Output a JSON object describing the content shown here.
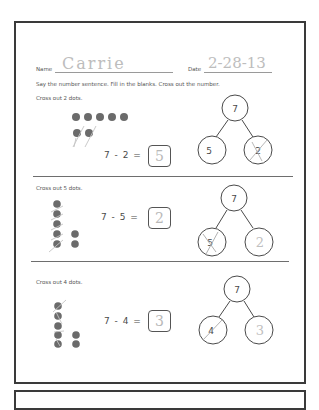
{
  "header": {
    "name_label": "Name",
    "name_value": "Carrie",
    "date_label": "Date",
    "date_value": "2-28-13",
    "instructions": "Say the number sentence. Fill in the blanks.  Cross out the number."
  },
  "problems": [
    {
      "prompt": "Cross out 2 dots.",
      "equation": "7 - 2 =",
      "answer": "5",
      "bond": {
        "whole": "7",
        "left": "5",
        "right": "2",
        "crossed": "right"
      },
      "dots_total": 7,
      "dots_crossed": 2
    },
    {
      "prompt": "Cross out 5 dots.",
      "equation": "7 - 5 =",
      "answer": "2",
      "bond": {
        "whole": "7",
        "left": "5",
        "right": "2",
        "crossed": "left"
      },
      "dots_total": 7,
      "dots_crossed": 5
    },
    {
      "prompt": "Cross out 4 dots.",
      "equation": "7 - 4 =",
      "answer": "3",
      "bond": {
        "whole": "7",
        "left": "4",
        "right": "3",
        "crossed": "left"
      },
      "dots_total": 7,
      "dots_crossed": 4
    }
  ],
  "colors": {
    "frame": "#3a3a3a",
    "dot": "#6b6b6b",
    "pencil": "#bdbdbd",
    "text": "#555555"
  }
}
